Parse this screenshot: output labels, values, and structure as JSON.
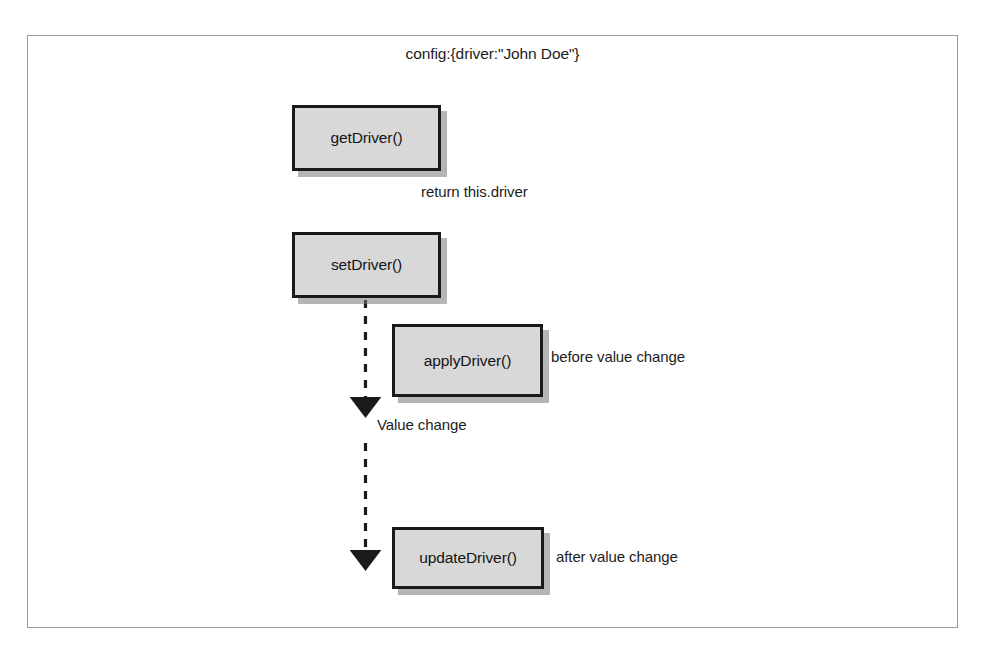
{
  "figure": {
    "title": "config:{driver:\"John Doe\"}",
    "border_color": "#9a9a9a",
    "background": "#ffffff"
  },
  "style": {
    "node_fill": "#d8d8d8",
    "node_border": "#1a1a1a",
    "node_shadow": "#787878",
    "text_color": "#1c1c1c",
    "connector_color": "#1a1a1a"
  },
  "nodes": [
    {
      "id": "getDriver",
      "label": "getDriver()"
    },
    {
      "id": "setDriver",
      "label": "setDriver()"
    },
    {
      "id": "applyDriver",
      "label": "applyDriver()"
    },
    {
      "id": "updateDriver",
      "label": "updateDriver()"
    }
  ],
  "annotations": [
    {
      "id": "return",
      "text": "return this.driver"
    },
    {
      "id": "before",
      "text": "before value change"
    },
    {
      "id": "valuechange",
      "text": "Value change"
    },
    {
      "id": "after",
      "text": "after value change"
    }
  ],
  "connectors": [
    {
      "id": "setDriver-to-valuechange",
      "style": "dashed",
      "arrowhead": "solid-triangle",
      "from": "setDriver",
      "to": "Value change"
    },
    {
      "id": "valuechange-to-updateDriver",
      "style": "dashed",
      "arrowhead": "solid-triangle",
      "from": "Value change",
      "to": "updateDriver"
    }
  ]
}
